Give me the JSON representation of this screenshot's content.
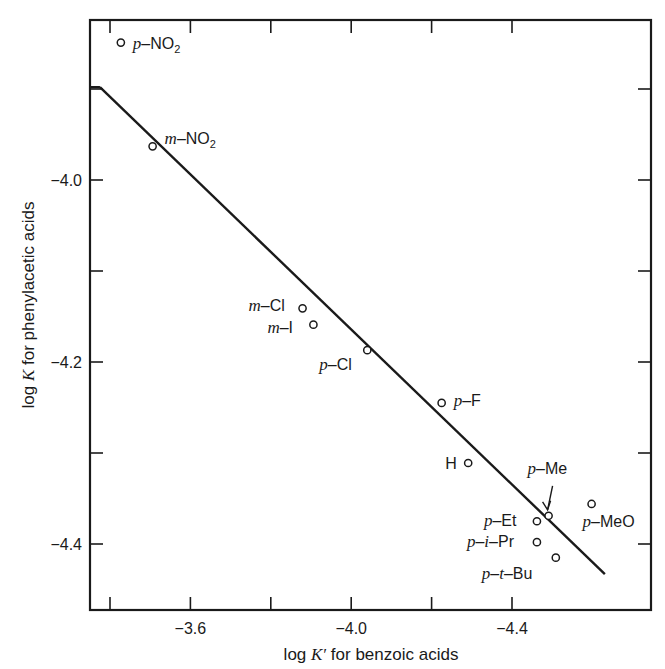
{
  "chart_data": {
    "type": "scatter",
    "title": "",
    "xlabel": "log K′ for benzoic acids",
    "ylabel": "log K for phenylacetic acids",
    "xlim": [
      -3.35,
      -4.74
    ],
    "ylim": [
      -4.474,
      -3.824
    ],
    "x_ticks": [
      -3.4,
      -3.6,
      -3.8,
      -4.0,
      -4.2,
      -4.4
    ],
    "x_tick_labels": [
      "",
      "−3.6",
      "",
      "−4.0",
      "",
      "−4.4"
    ],
    "y_ticks": [
      -3.9,
      -4.0,
      -4.1,
      -4.2,
      -4.3,
      -4.4
    ],
    "y_tick_labels": [
      "",
      "−4.0",
      "",
      "−4.2",
      "",
      "−4.4"
    ],
    "grid": false,
    "legend": null,
    "points": [
      {
        "label": "p–NO₂",
        "x": -3.427,
        "y": -3.849
      },
      {
        "label": "m–NO₂",
        "x": -3.506,
        "y": -3.963
      },
      {
        "label": "m–Cl",
        "x": -3.879,
        "y": -4.141
      },
      {
        "label": "m–I",
        "x": -3.906,
        "y": -4.159
      },
      {
        "label": "p–Cl",
        "x": -4.04,
        "y": -4.187
      },
      {
        "label": "p–F",
        "x": -4.225,
        "y": -4.245
      },
      {
        "label": "H",
        "x": -4.291,
        "y": -4.311
      },
      {
        "label": "p–Me",
        "x": -4.491,
        "y": -4.369
      },
      {
        "label": "p–Et",
        "x": -4.462,
        "y": -4.375
      },
      {
        "label": "p–i–Pr",
        "x": -4.462,
        "y": -4.398
      },
      {
        "label": "p–t–Bu",
        "x": -4.509,
        "y": -4.415
      },
      {
        "label": "p–MeO",
        "x": -4.598,
        "y": -4.356
      }
    ],
    "fit_line": {
      "x": [
        -3.375,
        -4.631
      ],
      "y": [
        -3.898,
        -4.433
      ]
    }
  },
  "labels": {
    "xlabel_pre": "log ",
    "xlabel_var": "K′",
    "xlabel_post": " for benzoic acids",
    "ylabel_pre": "log ",
    "ylabel_var": "K",
    "ylabel_post": " for phenylacetic acids"
  },
  "point_labels": [
    {
      "prefix": "p",
      "rest": "–NO",
      "sub": "2",
      "dx": 12,
      "dy": 6,
      "anchor": "start"
    },
    {
      "prefix": "m",
      "rest": "–NO",
      "sub": "2",
      "dx": 12,
      "dy": -2,
      "anchor": "start"
    },
    {
      "prefix": "m",
      "rest": "–Cl",
      "sub": "",
      "dx": -54,
      "dy": 3,
      "anchor": "start"
    },
    {
      "prefix": "m",
      "rest": "–I",
      "sub": "",
      "dx": -46,
      "dy": 8,
      "anchor": "start"
    },
    {
      "prefix": "p",
      "rest": "–Cl",
      "sub": "",
      "dx": -48,
      "dy": 20,
      "anchor": "start"
    },
    {
      "prefix": "p",
      "rest": "–F",
      "sub": "",
      "dx": 12,
      "dy": 3,
      "anchor": "start"
    },
    {
      "prefix": "",
      "rest": "H",
      "sub": "",
      "dx": -23,
      "dy": 6,
      "anchor": "start"
    },
    {
      "prefix": "p",
      "rest": "–Me",
      "sub": "",
      "dx": -21,
      "dy": -42,
      "anchor": "start"
    },
    {
      "prefix": "p",
      "rest": "–Et",
      "sub": "",
      "dx": -53,
      "dy": 5,
      "anchor": "start"
    },
    {
      "prefix": "p",
      "rest": "–i–Pr",
      "sub": "",
      "dx": -70,
      "dy": 5,
      "anchor": "start"
    },
    {
      "prefix": "p",
      "rest": "–t–Bu",
      "sub": "",
      "dx": -74,
      "dy": 21,
      "anchor": "start"
    },
    {
      "prefix": "p",
      "rest": "–MeO",
      "sub": "",
      "dx": -9,
      "dy": 23,
      "anchor": "start"
    }
  ],
  "colors": {
    "ink": "#1a1a1a",
    "background": "#ffffff"
  }
}
